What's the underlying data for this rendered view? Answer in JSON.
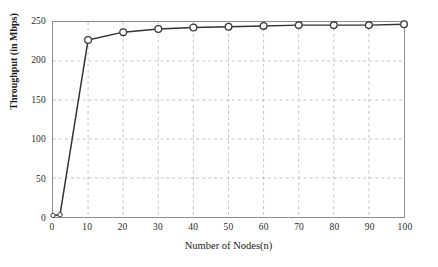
{
  "chart_data": {
    "type": "line",
    "title": "",
    "xlabel": "Number of Nodes(n)",
    "ylabel": "Throughput (in Mbps)",
    "xlim": [
      0,
      100
    ],
    "ylim": [
      0,
      250
    ],
    "xticks": [
      0,
      10,
      20,
      30,
      40,
      50,
      60,
      70,
      80,
      90,
      100
    ],
    "yticks": [
      0,
      50,
      100,
      150,
      200,
      250
    ],
    "xtick_labels": [
      "0",
      "10",
      "20",
      "30",
      "40",
      "50",
      "60",
      "70",
      "80",
      "90",
      "100"
    ],
    "ytick_labels": [
      "0",
      "50",
      "100",
      "150",
      "200",
      "250"
    ],
    "grid": true,
    "grid_style": "dashed",
    "legend": false,
    "legend_position": "none",
    "marker": "circle-open",
    "series": [
      {
        "name": "Throughput",
        "x": [
          0,
          2,
          10,
          20,
          30,
          40,
          50,
          60,
          70,
          80,
          90,
          100
        ],
        "values": [
          2,
          3,
          227,
          237,
          241,
          243,
          244,
          245,
          246,
          246,
          246,
          247
        ]
      }
    ]
  },
  "colors": {
    "line": "#333333",
    "marker_edge": "#3a3a3a",
    "marker_face": "#ffffff",
    "grid": "#b4b4b4",
    "frame": "#8d8d8d",
    "text": "#1a1a1a",
    "background": "#ffffff"
  }
}
